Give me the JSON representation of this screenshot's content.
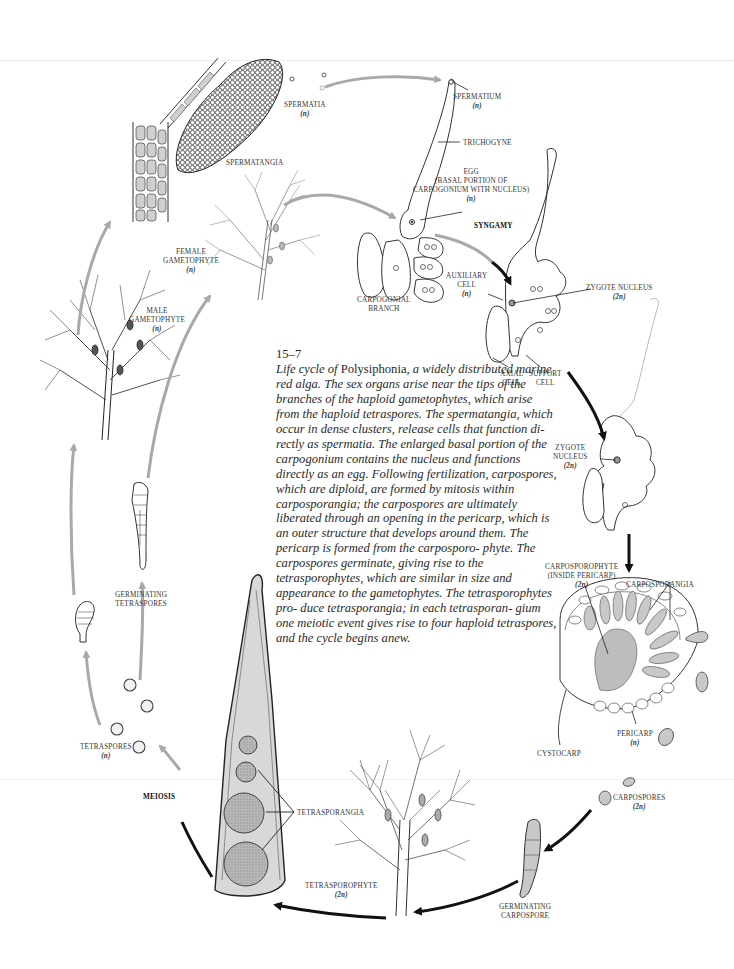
{
  "figure": {
    "number": "15–7",
    "caption_prefix": "Life cycle of ",
    "caption_genus": "Polysiphonia",
    "caption_rest": ", a widely distributed marine red alga. The sex organs arise near the tips of the branches of the haploid gametophytes, which arise from the haploid tetraspores. The spermatangia, which occur in dense clusters, release cells that function di- rectly as spermatia. The enlarged basal portion of the carpogonium contains the nucleus and functions directly as an egg. Following fertilization, carpospores, which are diploid, are formed by mitosis within carposporangia; the carpospores are ultimately liberated through an opening in the pericarp, which is an outer structure that develops around them. The pericarp is formed from the carposporo- phyte. The carpospores germinate, giving rise to the tetrasporophytes, which are similar in size and appearance to the gametophytes. The tetrasporophytes pro- duce tetrasporangia; in each tetrasporan- gium one meiotic event gives rise to four haploid tetraspores, and the cycle begins anew."
  },
  "labels": {
    "spermatia": "SPERMATIA",
    "spermatia_ploidy": "(n)",
    "spermatangia": "SPERMATANGIA",
    "spermatium": "SPERMATIUM",
    "spermatium_ploidy": "(n)",
    "trichogyne": "TRICHOGYNE",
    "egg": "EGG",
    "egg_desc_1": "(BASAL PORTION OF",
    "egg_desc_2": "CARPOGONIUM WITH NUCLEUS)",
    "egg_ploidy": "(n)",
    "syngamy": "SYNGAMY",
    "female_gametophyte_1": "FEMALE",
    "female_gametophyte_2": "GAMETOPHYTE",
    "female_gametophyte_ploidy": "(n)",
    "male_gametophyte_1": "MALE",
    "male_gametophyte_2": "GAMETOPHYTE",
    "male_gametophyte_ploidy": "(n)",
    "carpogonial_branch_1": "CARPOGONIAL",
    "carpogonial_branch_2": "BRANCH",
    "auxiliary_cell_1": "AUXILIARY",
    "auxiliary_cell_2": "CELL",
    "auxiliary_cell_ploidy": "(n)",
    "zygote_nucleus_top": "ZYGOTE NUCLEUS",
    "zygote_nucleus_top_ploidy": "(2n)",
    "axial_cell_1": "AXIAL",
    "axial_cell_2": "CELL",
    "support_cell_1": "SUPPORT",
    "support_cell_2": "CELL",
    "zygote_nucleus_mid_1": "ZYGOTE",
    "zygote_nucleus_mid_2": "NUCLEUS",
    "zygote_nucleus_mid_ploidy": "(2n)",
    "carposporophyte_1": "CARPOSPOROPHYTE",
    "carposporophyte_2": "(INSIDE PERICARP)",
    "carposporophyte_ploidy": "(2n)",
    "carposporangia": "CARPOSPORANGIA",
    "pericarp": "PERICARP",
    "pericarp_ploidy": "(n)",
    "cystocarp": "CYSTOCARP",
    "carpospores": "CARPOSPORES",
    "carpospores_ploidy": "(2n)",
    "germinating_carpospore_1": "GERMINATING",
    "germinating_carpospore_2": "CARPOSPORE",
    "tetrasporophyte": "TETRASPOROPHYTE",
    "tetrasporophyte_ploidy": "(2n)",
    "tetrasporangia": "TETRASPORANGIA",
    "meiosis": "MEIOSIS",
    "tetraspores": "TETRASPORES",
    "tetraspores_ploidy": "(n)",
    "germinating_tetraspores_1": "GERMINATING",
    "germinating_tetraspores_2": "TETRASPORES"
  },
  "colors": {
    "haploid_arrow": "#a9a9a9",
    "diploid_arrow": "#111111",
    "cell_fill": "#d6d6d6",
    "line": "#333333"
  }
}
